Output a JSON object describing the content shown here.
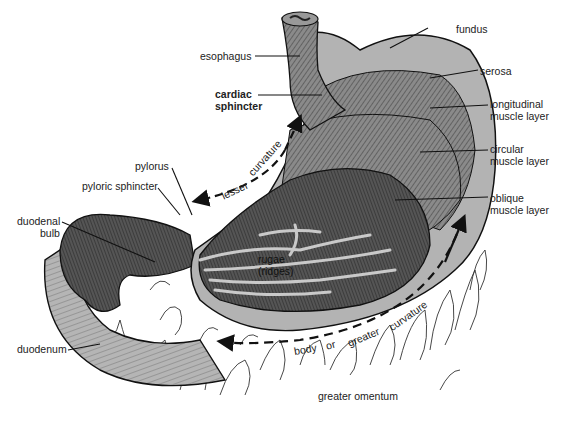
{
  "labels": {
    "fundus": "fundus",
    "esophagus": "esophagus",
    "serosa": "serosa",
    "cardiac_1": "cardiac",
    "cardiac_2": "sphincter",
    "longitudinal_1": "longitudinal",
    "longitudinal_2": "muscle layer",
    "circular_1": "circular",
    "circular_2": "muscle layer",
    "pylorus": "pylorus",
    "pyloric_sphincter": "pyloric sphincter",
    "oblique_1": "oblique",
    "oblique_2": "muscle layer",
    "duodenal_1": "duodenal",
    "duodenal_2": "bulb",
    "rugae_1": "rugae",
    "rugae_2": "(ridges)",
    "duodenum": "duodenum",
    "greater_omentum": "greater omentum"
  },
  "curvature_labels": {
    "lesser": "lesser",
    "lesser_curvature": "curvature",
    "body": "body",
    "or": "or",
    "greater": "greater",
    "greater_curvature": "curvature"
  },
  "colors": {
    "tissue_light": "#b3b3b3",
    "tissue_mid": "#8a8a8a",
    "tissue_dark": "#4a4a4a",
    "ink": "#1a1a1a"
  }
}
